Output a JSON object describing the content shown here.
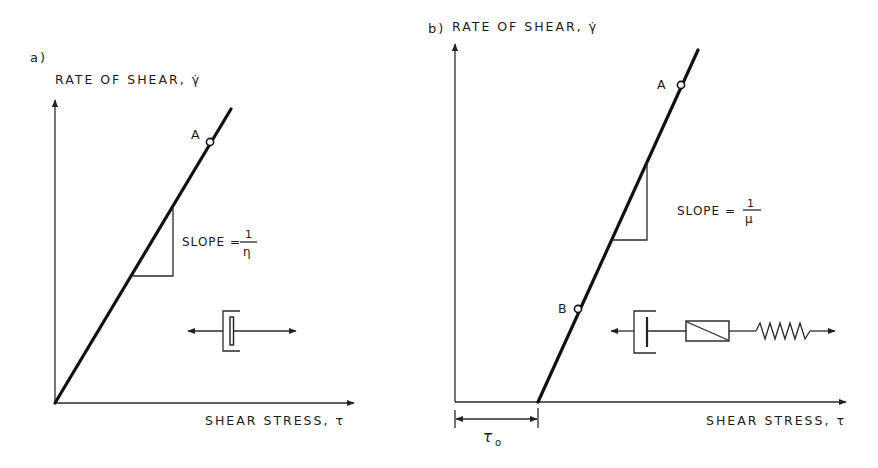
{
  "panels": [
    {
      "id": "a",
      "panel_label": "a)",
      "y_axis_label": "RATE OF SHEAR, γ̇",
      "x_axis_label": "SHEAR STRESS, τ",
      "point_labels": [
        "A"
      ],
      "slope_label": "SLOPE =",
      "slope_numerator": "1",
      "slope_denominator": "η",
      "model": "Newtonian dashpot",
      "line": {
        "x0_intercept": 0
      }
    },
    {
      "id": "b",
      "panel_label": "b)",
      "y_axis_label": "RATE OF SHEAR, γ̇",
      "x_axis_label": "SHEAR STRESS, τ",
      "point_labels": [
        "A",
        "B"
      ],
      "slope_label": "SLOPE =",
      "slope_numerator": "1",
      "slope_denominator": "μ",
      "yield_stress_label": "τ",
      "yield_stress_subscript": "o",
      "model": "Bingham: dashpot + friction slider + spring",
      "line": {
        "x0_intercept": "τo"
      }
    }
  ],
  "colors": {
    "ink": "#1a1a1a",
    "background": "#ffffff"
  }
}
